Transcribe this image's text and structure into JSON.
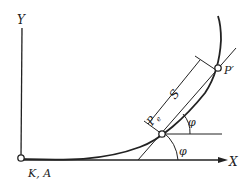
{
  "diagram": {
    "axes": {
      "x_label": "X",
      "y_label": "Y",
      "origin_label": "K, A"
    },
    "points": {
      "pe_label": "P",
      "pe_subscript": "e",
      "p_prime_label": "P′"
    },
    "dimension": {
      "label": "S"
    },
    "angles": {
      "upper": "φ",
      "lower": "φ"
    },
    "colors": {
      "stroke": "#222222",
      "background": "#ffffff"
    }
  }
}
